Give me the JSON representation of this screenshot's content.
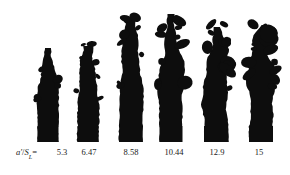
{
  "figure": {
    "width": 290,
    "height": 175,
    "background_color": "#ffffff",
    "ink_color": "#0d0d0d"
  },
  "axis": {
    "label_prefix_var": "a'",
    "label_slash": "/",
    "label_S": "S",
    "label_sub": "L",
    "label_equals": "="
  },
  "chart_data": {
    "type": "scatter",
    "title": "",
    "subtitle": "",
    "xlabel": "a'/S_L",
    "ylabel": "",
    "grid": false,
    "legend": null,
    "categories": [
      "5.3",
      "6.47",
      "8.58",
      "10.44",
      "12.9",
      "15"
    ],
    "values": [
      5.3,
      6.47,
      8.58,
      10.44,
      12.9,
      15
    ],
    "tick_labels": [
      "5.3",
      "6.47",
      "8.58",
      "10.44",
      "12.9",
      "15"
    ],
    "panels": [
      {
        "label": "5.3",
        "center_x": 48,
        "base_y": 142,
        "top_y": 48,
        "height_px": 94,
        "width_px": 21,
        "tick_x": 62,
        "seed": 11
      },
      {
        "label": "6.47",
        "center_x": 88,
        "base_y": 142,
        "top_y": 46,
        "height_px": 96,
        "width_px": 21,
        "tick_x": 89,
        "seed": 23
      },
      {
        "label": "8.58",
        "center_x": 131,
        "base_y": 142,
        "top_y": 19,
        "height_px": 123,
        "width_px": 23,
        "tick_x": 131,
        "seed": 37
      },
      {
        "label": "10.44",
        "center_x": 171,
        "base_y": 142,
        "top_y": 14,
        "height_px": 128,
        "width_px": 23,
        "tick_x": 174,
        "seed": 53
      },
      {
        "label": "12.9",
        "center_x": 216,
        "base_y": 142,
        "top_y": 27,
        "height_px": 115,
        "width_px": 24,
        "tick_x": 217,
        "seed": 71
      },
      {
        "label": "15",
        "center_x": 261,
        "base_y": 142,
        "top_y": 25,
        "height_px": 117,
        "width_px": 24,
        "tick_x": 259,
        "seed": 97
      }
    ]
  }
}
